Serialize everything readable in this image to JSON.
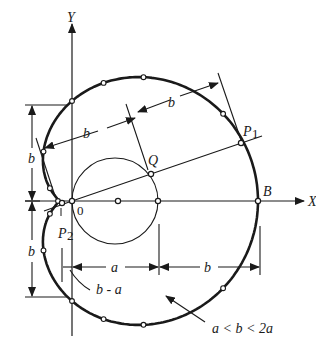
{
  "labels": {
    "y_axis": "Y",
    "x_axis": "X",
    "origin": "0",
    "point_q": "Q",
    "point_p1": "P",
    "point_p1_sub": "1",
    "point_p2": "P",
    "point_p2_sub": "2",
    "point_b": "B",
    "dim_b_top": "b",
    "dim_b_slant": "b",
    "dim_b_left_upper": "b",
    "dim_b_left_lower": "b",
    "dim_a_bottom": "a",
    "dim_b_bottom": "b",
    "dim_b_minus_a": "b - a",
    "condition": "a < b < 2a"
  },
  "colors": {
    "ink": "#1a1a1a",
    "paper": "#ffffff"
  }
}
